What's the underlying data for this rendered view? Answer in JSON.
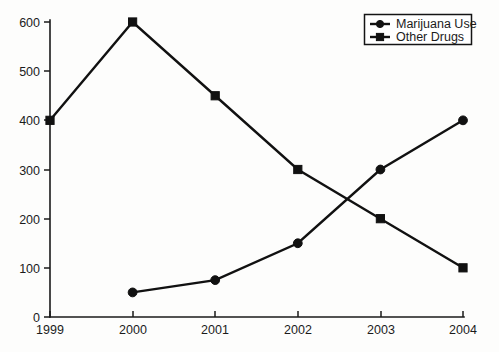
{
  "chart_data": {
    "type": "line",
    "title": "",
    "xlabel": "",
    "ylabel": "",
    "categories": [
      "1999",
      "2000",
      "2001",
      "2002",
      "2003",
      "2004"
    ],
    "x_tick_labels": [
      "1999",
      "2000",
      "2001",
      "2002",
      "2003",
      "2004"
    ],
    "y_tick_labels": [
      "0",
      "100",
      "200",
      "300",
      "400",
      "500",
      "600"
    ],
    "y_ticks": [
      0,
      100,
      200,
      300,
      400,
      500,
      600
    ],
    "ylim": [
      0,
      600
    ],
    "grid": false,
    "legend_position": "top-right",
    "series": [
      {
        "name": "Marijuana Use",
        "marker": "circle",
        "color": "#111111",
        "x": [
          "2000",
          "2001",
          "2002",
          "2003",
          "2004"
        ],
        "values": [
          50,
          75,
          150,
          300,
          400
        ]
      },
      {
        "name": "Other Drugs",
        "marker": "square",
        "color": "#111111",
        "x": [
          "1999",
          "2000",
          "2001",
          "2002",
          "2003",
          "2004"
        ],
        "values": [
          400,
          600,
          450,
          300,
          200,
          100
        ]
      }
    ]
  },
  "legend": {
    "entries": [
      {
        "label": "Marijuana Use",
        "marker": "circle"
      },
      {
        "label": "Other Drugs",
        "marker": "square"
      }
    ]
  },
  "axes": {
    "y_labels": [
      "600",
      "500",
      "400",
      "300",
      "200",
      "100",
      "0"
    ],
    "x_labels": [
      "1999",
      "2000",
      "2001",
      "2002",
      "2003",
      "2004"
    ]
  }
}
